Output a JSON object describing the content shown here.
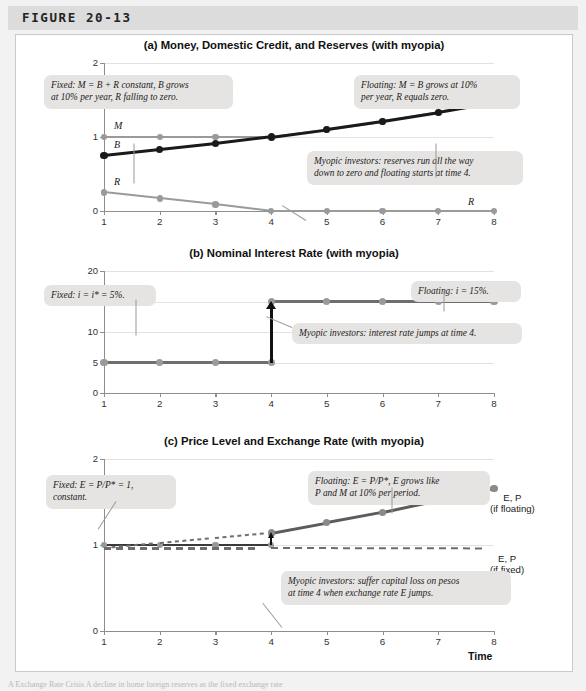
{
  "figure": {
    "label": "FIGURE 20-13",
    "caption_sliver": "A Exchange Rate Crisis A decline in home foreign reserves as the fixed exchange rate"
  },
  "colors": {
    "grey_line": "#9a9a9a",
    "dark_line": "#5c5c5c",
    "black_line": "#1a1a1a",
    "marker_grey": "#9a9a9a",
    "marker_dark": "#6e6e6e",
    "marker_black": "#1a1a1a",
    "callout_bg": "#e6e4e2",
    "grid": "#e2e2e2",
    "axis": "#8e8e8e",
    "header_band": "#dcdcdc",
    "page_bg": "#f2f2f2"
  },
  "panels": [
    {
      "id": "a",
      "title": "(a) Money, Domestic Credit, and Reserves (with myopia)",
      "ylim": [
        0,
        2
      ],
      "yticks": [
        0,
        1,
        2
      ],
      "ytick_labels": [
        "0",
        "1",
        "2"
      ],
      "xlim": [
        1,
        8
      ],
      "xticks": [
        1,
        2,
        3,
        4,
        5,
        6,
        7,
        8
      ],
      "xtick_labels": [
        "1",
        "2",
        "3",
        "4",
        "5",
        "6",
        "7",
        "8"
      ],
      "xlabel": "",
      "series": [
        {
          "name": "M",
          "label_left": "M",
          "label_right": "",
          "color": "#9a9a9a",
          "marker_color": "#9a9a9a",
          "width": 2.2,
          "style": "solid",
          "x": [
            1,
            2,
            3,
            4,
            5,
            6,
            7,
            8
          ],
          "y": [
            1.0,
            1.0,
            1.0,
            1.0,
            1.1,
            1.21,
            1.33,
            1.46
          ]
        },
        {
          "name": "B",
          "label_left": "B",
          "label_right": "M = B",
          "color": "#1a1a1a",
          "marker_color": "#1a1a1a",
          "width": 2.6,
          "style": "solid",
          "x": [
            1,
            2,
            3,
            4,
            5,
            6,
            7,
            8
          ],
          "y": [
            0.75,
            0.83,
            0.91,
            1.0,
            1.1,
            1.21,
            1.33,
            1.46
          ]
        },
        {
          "name": "R",
          "label_left": "R",
          "label_right": "R",
          "color": "#9a9a9a",
          "marker_color": "#9a9a9a",
          "width": 2.2,
          "style": "solid",
          "x": [
            1,
            2,
            3,
            4,
            5,
            6,
            7,
            8
          ],
          "y": [
            0.25,
            0.17,
            0.09,
            0.0,
            0.0,
            0.0,
            0.0,
            0.0
          ]
        }
      ],
      "callouts": [
        {
          "id": "fixed",
          "text": "Fixed: M = B + R constant, B grows\nat 10% per year, R falling to zero.",
          "x": 28,
          "y": 12,
          "w": 175
        },
        {
          "id": "floating",
          "text": "Floating: M = B grows at 10%\nper year, R equals zero.",
          "x": 338,
          "y": 12,
          "w": 152
        },
        {
          "id": "myopic",
          "text": "Myopic investors: reserves run all the way\ndown to zero and floating starts at time 4.",
          "x": 291,
          "y": 88,
          "w": 202
        }
      ]
    },
    {
      "id": "b",
      "title": "(b) Nominal Interest Rate (with myopia)",
      "ylim": [
        0,
        20
      ],
      "yticks": [
        0,
        5,
        10,
        15,
        20
      ],
      "ytick_labels": [
        "0",
        "5",
        "10",
        "15",
        "20"
      ],
      "xlim": [
        1,
        8
      ],
      "xticks": [
        1,
        2,
        3,
        4,
        5,
        6,
        7,
        8
      ],
      "xtick_labels": [
        "1",
        "2",
        "3",
        "4",
        "5",
        "6",
        "7",
        "8"
      ],
      "xlabel": "",
      "series": [
        {
          "name": "i-fixed",
          "label_left": "",
          "label_right": "",
          "color": "#6e6e6e",
          "marker_color": "#9a9a9a",
          "width": 2.6,
          "style": "solid",
          "x": [
            1,
            2,
            3,
            4
          ],
          "y": [
            5,
            5,
            5,
            5
          ]
        },
        {
          "name": "i-floating",
          "label_left": "",
          "label_right": "i",
          "color": "#6e6e6e",
          "marker_color": "#9a9a9a",
          "width": 2.6,
          "style": "solid",
          "x": [
            4,
            5,
            6,
            7,
            8
          ],
          "y": [
            15,
            15,
            15,
            15,
            15
          ]
        }
      ],
      "jump": {
        "x": 4,
        "from": 5,
        "to": 15
      },
      "callouts": [
        {
          "id": "fixed",
          "text": "Fixed: i = i* = 5%.",
          "x": 28,
          "y": 14,
          "w": 98
        },
        {
          "id": "floating",
          "text": "Floating: i = 15%.",
          "x": 395,
          "y": 10,
          "w": 96
        },
        {
          "id": "myopic",
          "text": "Myopic investors: interest rate jumps at time 4.",
          "x": 276,
          "y": 52,
          "w": 216
        }
      ]
    },
    {
      "id": "c",
      "title": "(c) Price Level and Exchange Rate (with myopia)",
      "ylim": [
        0,
        2
      ],
      "yticks": [
        0,
        1,
        2
      ],
      "ytick_labels": [
        "0",
        "1",
        "2"
      ],
      "xlim": [
        1,
        8
      ],
      "xticks": [
        1,
        2,
        3,
        4,
        5,
        6,
        7,
        8
      ],
      "xtick_labels": [
        "1",
        "2",
        "3",
        "4",
        "5",
        "6",
        "7",
        "8"
      ],
      "xlabel": "Time",
      "series": [
        {
          "name": "EP-fixed-solid",
          "label_left": "",
          "label_right": "",
          "color": "#3a3a3a",
          "marker_color": "#9a9a9a",
          "width": 2.2,
          "style": "solid",
          "x": [
            1,
            2,
            3,
            4
          ],
          "y": [
            1.0,
            1.0,
            1.0,
            1.0
          ]
        },
        {
          "name": "EP-if-fixed",
          "label_left": "",
          "label_right": "E, P\n(if fixed)",
          "color": "#6e6e6e",
          "marker_color": "#6e6e6e",
          "width": 2.2,
          "style": "dashed",
          "x": [
            1,
            4,
            8
          ],
          "y": [
            0.96,
            0.96,
            0.955
          ]
        },
        {
          "name": "P-dotted-rising",
          "label_left": "",
          "label_right": "",
          "color": "#6e6e6e",
          "marker_color": "#6e6e6e",
          "width": 2.4,
          "style": "dotted",
          "x": [
            1,
            2,
            3,
            4
          ],
          "y": [
            0.96,
            1.02,
            1.08,
            1.14
          ]
        },
        {
          "name": "EP-if-floating",
          "label_left": "",
          "label_right": "E, P\n(if floating)",
          "color": "#5c5c5c",
          "marker_color": "#8a8a8a",
          "width": 2.6,
          "style": "solid",
          "x": [
            4,
            5,
            6,
            7,
            8
          ],
          "y": [
            1.14,
            1.26,
            1.38,
            1.52,
            1.66
          ]
        }
      ],
      "jump": {
        "x": 4,
        "from": 1.0,
        "to": 1.14
      },
      "callouts": [
        {
          "id": "fixed",
          "text": "Fixed: E = P/P* = 1,\nconstant.",
          "x": 30,
          "y": 16,
          "w": 116
        },
        {
          "id": "floating",
          "text": "Floating: E = P/P*, E grows like\nP and M at 10% per period.",
          "x": 292,
          "y": 12,
          "w": 168
        },
        {
          "id": "myopic",
          "text": "Myopic investors: suffer capital loss on pesos\nat time 4 when exchange rate E jumps.",
          "x": 265,
          "y": 112,
          "w": 216
        }
      ]
    }
  ]
}
